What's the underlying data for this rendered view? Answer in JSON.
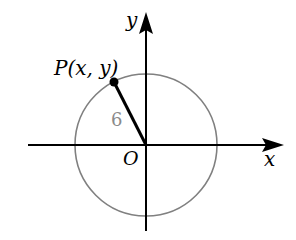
{
  "diagram": {
    "type": "unit-circle-coordinate",
    "axes": {
      "x_label": "x",
      "y_label": "y",
      "origin_label": "O"
    },
    "circle": {
      "radius_label": "6",
      "stroke_color": "#808080"
    },
    "point": {
      "label": "P(x, y)",
      "color": "#000000"
    },
    "colors": {
      "axis": "#000000",
      "circle": "#808080",
      "radius_label": "#8a8a8a",
      "segment": "#000000"
    }
  }
}
